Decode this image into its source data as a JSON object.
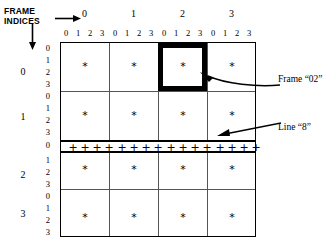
{
  "corner": {
    "label_line1": "FRAME",
    "label_line2": "INDICES"
  },
  "axes": {
    "frame_indices": [
      "0",
      "1",
      "2",
      "3"
    ],
    "sub_indices": [
      "0",
      "1",
      "2",
      "3"
    ],
    "top_sub_labels": [
      "0",
      "1",
      "2",
      "3",
      "0",
      "1",
      "2",
      "3",
      "0",
      "1",
      "2",
      "3",
      "0",
      "1",
      "2",
      "3"
    ],
    "left_sub_labels": [
      "0",
      "1",
      "2",
      "3",
      "0",
      "1",
      "2",
      "3",
      "0",
      "1",
      "2",
      "3",
      "0",
      "1",
      "2",
      "3"
    ]
  },
  "grid": {
    "rows": 4,
    "cols": 4,
    "cell_symbol": "*",
    "plus_symbol": "+",
    "plus_count": 16,
    "highlight_row": 0,
    "highlight_col": 2,
    "plus_row_frame": 2,
    "plus_row_sub": 0
  },
  "annotations": {
    "frame_label": "Frame “02”",
    "line_label": "Line “8”"
  },
  "colors": {
    "ink": "#000000",
    "grid_line": "#555555",
    "background": "#ffffff"
  }
}
